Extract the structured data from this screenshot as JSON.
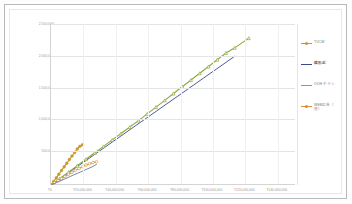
{
  "chart_data": {
    "type": "scatter",
    "title": "",
    "xlabel": "",
    "ylabel": "",
    "xlim": [
      0,
      140000000
    ],
    "ylim": [
      0,
      2500000
    ],
    "grid": true,
    "legend_position": "right",
    "x_ticks": [
      "¥0",
      "¥20,000,000",
      "¥40,000,000",
      "¥60,000,000",
      "¥80,000,000",
      "¥100,000,000",
      "¥120,000,000",
      "¥140,000,000"
    ],
    "x_tick_values": [
      0,
      20000000,
      40000000,
      60000000,
      80000000,
      100000000,
      120000000,
      140000000
    ],
    "y_ticks": [
      "2,500,000",
      "2,000,000",
      "1,500,000",
      "1,000,000",
      "500,000",
      "0"
    ],
    "y_tick_values": [
      2500000,
      2000000,
      1500000,
      1000000,
      500000,
      0
    ],
    "series": [
      {
        "name": "TVCM",
        "color": "#c8972e",
        "marker": "circle",
        "points": [
          [
            0,
            0
          ],
          [
            1500000,
            55000
          ],
          [
            3000000,
            110000
          ],
          [
            4500000,
            168000
          ],
          [
            6000000,
            225000
          ],
          [
            7500000,
            282000
          ],
          [
            9000000,
            338000
          ],
          [
            10500000,
            395000
          ],
          [
            12000000,
            450000
          ],
          [
            13500000,
            505000
          ],
          [
            15000000,
            560000
          ],
          [
            16500000,
            600000
          ],
          [
            18000000,
            625000
          ]
        ]
      },
      {
        "name": "線形近似",
        "color": "#3b4a8c",
        "marker": "none",
        "points": [
          [
            0,
            0
          ],
          [
            105000000,
            2000000
          ]
        ]
      },
      {
        "name": "OOH チラシ",
        "color": "#8faa3c",
        "marker": "triangle",
        "points": [
          [
            0,
            0
          ],
          [
            5000000,
            100000
          ],
          [
            10000000,
            200000
          ],
          [
            15000000,
            300000
          ],
          [
            20000000,
            400000
          ],
          [
            25000000,
            500000
          ],
          [
            30000000,
            600000
          ],
          [
            35000000,
            700000
          ],
          [
            40000000,
            800000
          ],
          [
            45000000,
            900000
          ],
          [
            50000000,
            1000000
          ],
          [
            55000000,
            1105000
          ],
          [
            60000000,
            1210000
          ],
          [
            65000000,
            1315000
          ],
          [
            70000000,
            1420000
          ],
          [
            75000000,
            1525000
          ],
          [
            80000000,
            1630000
          ],
          [
            85000000,
            1735000
          ],
          [
            90000000,
            1840000
          ],
          [
            95000000,
            1945000
          ],
          [
            100000000,
            2050000
          ],
          [
            105000000,
            2130000
          ],
          [
            113000000,
            2280000
          ]
        ]
      },
      {
        "name": "WEB広告（他）",
        "color": "#d98f2b",
        "marker": "circle-dot",
        "points": [
          [
            0,
            0
          ],
          [
            2000000,
            35000
          ],
          [
            4000000,
            68000
          ],
          [
            6000000,
            100000
          ],
          [
            8000000,
            132000
          ],
          [
            10000000,
            165000
          ],
          [
            12000000,
            196000
          ],
          [
            14000000,
            228000
          ],
          [
            16000000,
            255000
          ],
          [
            18000000,
            285000
          ],
          [
            20000000,
            310000
          ],
          [
            22000000,
            330000
          ],
          [
            24000000,
            348000
          ],
          [
            26000000,
            360000
          ]
        ]
      },
      {
        "name": "青系系列",
        "color": "#6b7fa3",
        "marker": "none",
        "points": [
          [
            0,
            0
          ],
          [
            4000000,
            48000
          ],
          [
            8000000,
            96000
          ],
          [
            12000000,
            145000
          ],
          [
            16000000,
            192000
          ],
          [
            20000000,
            240000
          ],
          [
            24000000,
            288000
          ],
          [
            26000000,
            320000
          ]
        ]
      }
    ]
  },
  "legend": {
    "items": [
      {
        "label": "TVCM",
        "color": "#c8972e",
        "bold": false,
        "marker": "line-dot"
      },
      {
        "label": "線形近",
        "color": "#3b4a8c",
        "bold": true,
        "marker": "line"
      },
      {
        "label": "OOH チラシ",
        "color": "#8faa3c",
        "bold": false,
        "marker": "line"
      },
      {
        "label": "WEB広告（\n他）",
        "color": "#d98f2b",
        "bold": false,
        "marker": "line-dot"
      }
    ]
  },
  "axis": {
    "y_labels": [
      "2,500,000",
      "2,000,000",
      "1,500,000",
      "1,000,000",
      "500,000",
      "0"
    ],
    "x_labels": [
      "¥0",
      "¥20,000,000",
      "¥40,000,000",
      "¥60,000,000",
      "¥80,000,000",
      "¥100,000,000",
      "¥120,000,000",
      "¥140,000,000"
    ]
  }
}
